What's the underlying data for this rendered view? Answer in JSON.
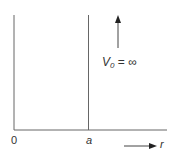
{
  "diagram": {
    "title": "",
    "potential_label_symbol": "V",
    "potential_label_subscript": "0",
    "potential_label_rest": " = ∞",
    "origin_label": "0",
    "wall_label": "a",
    "axis_label": "r",
    "line_color": "#555555"
  }
}
